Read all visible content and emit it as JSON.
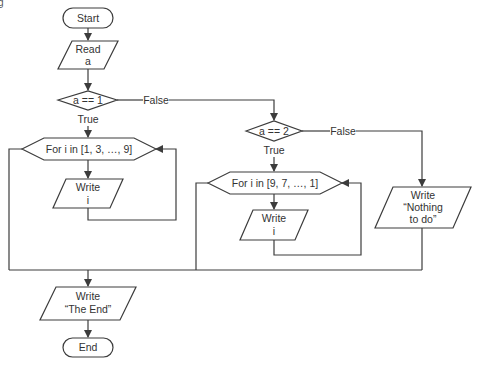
{
  "top_fragment": "g",
  "colors": {
    "stroke": "#3c3c3c",
    "text": "#333333",
    "background": "#ffffff"
  },
  "nodes": {
    "start": {
      "type": "terminal",
      "label": "Start"
    },
    "read_a": {
      "type": "io",
      "lines": [
        "Read",
        "a"
      ]
    },
    "cond1": {
      "type": "decision",
      "label": "a == 1"
    },
    "loop1": {
      "type": "loop",
      "label": "For i in [1, 3, …, 9]"
    },
    "write_i_1": {
      "type": "io",
      "lines": [
        "Write",
        "i"
      ]
    },
    "cond2": {
      "type": "decision",
      "label": "a == 2"
    },
    "loop2": {
      "type": "loop",
      "label": "For i in [9, 7, …, 1]"
    },
    "write_i_2": {
      "type": "io",
      "lines": [
        "Write",
        "i"
      ]
    },
    "write_nothing": {
      "type": "io",
      "lines": [
        "Write",
        "“Nothing",
        "to do”"
      ]
    },
    "write_end": {
      "type": "io",
      "lines": [
        "Write",
        "“The End”"
      ]
    },
    "end": {
      "type": "terminal",
      "label": "End"
    }
  },
  "edges": {
    "cond1_true": "True",
    "cond1_false": "False",
    "cond2_true": "True",
    "cond2_false": "False"
  }
}
